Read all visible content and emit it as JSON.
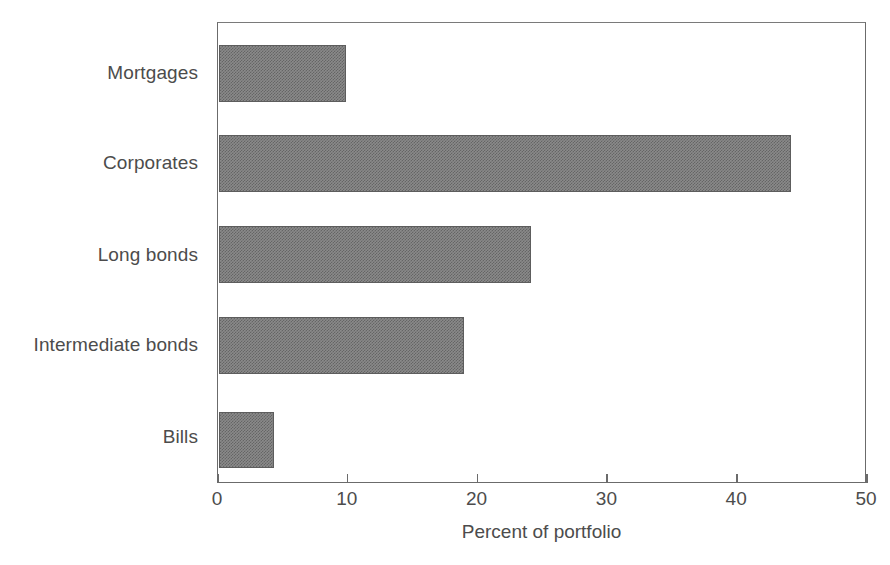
{
  "chart_data": {
    "type": "bar",
    "orientation": "horizontal",
    "title": "",
    "xlabel": "Percent of portfolio",
    "ylabel": "",
    "xlim": [
      0,
      50
    ],
    "xticks": [
      0,
      10,
      20,
      30,
      40,
      50
    ],
    "xtick_labels": [
      "0",
      "10",
      "20",
      "30",
      "40",
      "50"
    ],
    "grid": false,
    "legend": null,
    "categories": [
      "Mortgages",
      "Corporates",
      "Long bonds",
      "Intermediate bonds",
      "Bills"
    ],
    "values": [
      9.8,
      44.1,
      24.0,
      18.9,
      4.2
    ],
    "bar_color": "#8a8a8a",
    "bar_edge_color": "#5d5d5d",
    "frame_color": "#6b6b6b",
    "background_color": "#ffffff"
  },
  "axis": {
    "x_title": "Percent of portfolio",
    "ticks": [
      {
        "value": 0,
        "label": "0"
      },
      {
        "value": 10,
        "label": "10"
      },
      {
        "value": 20,
        "label": "20"
      },
      {
        "value": 30,
        "label": "30"
      },
      {
        "value": 40,
        "label": "40"
      },
      {
        "value": 50,
        "label": "50"
      }
    ]
  },
  "bars": [
    {
      "label": "Mortgages",
      "value": 9.8
    },
    {
      "label": "Corporates",
      "value": 44.1
    },
    {
      "label": "Long bonds",
      "value": 24.0
    },
    {
      "label": "Intermediate bonds",
      "value": 18.9
    },
    {
      "label": "Bills",
      "value": 4.2
    }
  ]
}
